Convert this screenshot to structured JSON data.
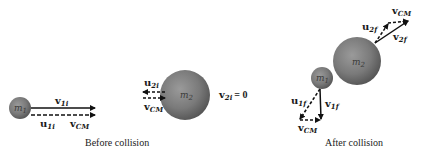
{
  "before": {
    "caption": "Before collision",
    "ball1": {
      "mass_label": "m",
      "mass_sub": "1"
    },
    "ball2": {
      "mass_label": "m",
      "mass_sub": "2"
    },
    "v1i": {
      "bold": "v",
      "sub": "1i"
    },
    "u1i": {
      "bold": "u",
      "sub": "1i"
    },
    "vcm1": {
      "bold": "v",
      "sub": "CM"
    },
    "u2i": {
      "bold": "u",
      "sub": "2i"
    },
    "vcm2": {
      "bold": "v",
      "sub": "CM"
    },
    "v2i": {
      "bold": "v",
      "sub": "2i",
      "eq": "= 0"
    }
  },
  "after": {
    "caption": "After collision",
    "ball1": {
      "mass_label": "m",
      "mass_sub": "1"
    },
    "ball2": {
      "mass_label": "m",
      "mass_sub": "2"
    },
    "vcm2": {
      "bold": "v",
      "sub": "CM"
    },
    "u2f": {
      "bold": "u",
      "sub": "2f"
    },
    "v2f": {
      "bold": "v",
      "sub": "2f"
    },
    "u1f": {
      "bold": "u",
      "sub": "1f"
    },
    "v1f": {
      "bold": "v",
      "sub": "1f"
    },
    "vcm1": {
      "bold": "v",
      "sub": "CM"
    }
  },
  "colors": {
    "ball": "#7a7a7a",
    "arrow": "#111111"
  }
}
